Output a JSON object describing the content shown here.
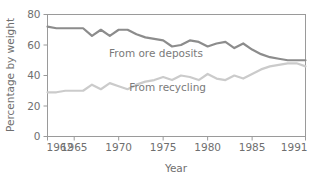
{
  "chart_data": {
    "type": "line",
    "title": "",
    "subtitle": "",
    "xlabel": "Year",
    "ylabel": "Percentage by weight",
    "xlim": [
      1962,
      1991
    ],
    "ylim": [
      0,
      80
    ],
    "grid": false,
    "legend_position": "inline-annotations",
    "x_tick_labels": [
      "1962",
      "1965",
      "1970",
      "1975",
      "1980",
      "1985",
      "1991"
    ],
    "x_tick_values": [
      1962,
      1965,
      1970,
      1975,
      1980,
      1985,
      1991
    ],
    "y_tick_labels": [
      "0",
      "20",
      "40",
      "60",
      "80"
    ],
    "y_tick_values": [
      0,
      20,
      40,
      60,
      80
    ],
    "x": [
      1962,
      1963,
      1964,
      1965,
      1966,
      1967,
      1968,
      1969,
      1970,
      1971,
      1972,
      1973,
      1974,
      1975,
      1976,
      1977,
      1978,
      1979,
      1980,
      1981,
      1982,
      1983,
      1984,
      1985,
      1986,
      1987,
      1988,
      1989,
      1990,
      1991
    ],
    "series": [
      {
        "name": "From ore deposits",
        "label": "From ore deposits",
        "color": "#8c8c8c",
        "linewidth": 2.2,
        "label_x": 1974.2,
        "label_y": 52,
        "values": [
          72,
          71,
          71,
          71,
          71,
          66,
          70,
          66,
          70,
          70,
          67,
          65,
          64,
          63,
          59,
          60,
          63,
          62,
          59,
          61,
          62,
          58,
          61,
          57,
          54,
          52,
          51,
          50,
          50,
          50
        ]
      },
      {
        "name": "From recycling",
        "label": "From recycling",
        "color": "#cbcbcb",
        "linewidth": 2.2,
        "label_x": 1975.5,
        "label_y": 30,
        "values": [
          29,
          29,
          30,
          30,
          30,
          34,
          31,
          35,
          33,
          31,
          34,
          36,
          37,
          39,
          37,
          40,
          39,
          37,
          41,
          38,
          37,
          40,
          38,
          41,
          44,
          46,
          47,
          48,
          48,
          46
        ]
      }
    ],
    "annotations": [
      {
        "text": "From ore deposits",
        "x": 1974.2,
        "y": 52
      },
      {
        "text": "From recycling",
        "x": 1975.5,
        "y": 30
      }
    ]
  },
  "axis": {
    "frame_color": "#9a9a9a",
    "tick_color": "#9a9a9a",
    "text_color": "#6f6f6f"
  }
}
